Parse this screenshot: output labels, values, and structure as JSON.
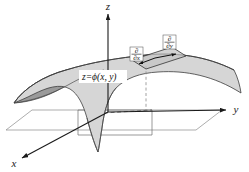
{
  "figure": {
    "caption_equation": {
      "lhs": "z",
      "equals": "=",
      "func": "ϕ",
      "args": "(x, y)",
      "full": "z=ϕ(x, y)"
    },
    "axes": [
      {
        "name": "z-axis",
        "label": "z",
        "direction": "up"
      },
      {
        "name": "y-axis",
        "label": "y",
        "direction": "right"
      },
      {
        "name": "x-axis",
        "label": "x",
        "direction": "lower-left"
      }
    ],
    "tangent_patch": {
      "name": "tangent-plane-patch",
      "vectors": [
        {
          "name": "partial-x-vector",
          "numerator": "∂",
          "denominator": "∂x",
          "direction": "lower-left"
        },
        {
          "name": "partial-y-vector",
          "numerator": "∂",
          "denominator": "∂y",
          "direction": "right"
        }
      ]
    },
    "surface": {
      "name": "saddle-surface",
      "type": "saddle",
      "top_fill": "#d6d6d6",
      "under_fill": "#9a9a9a",
      "stroke": "#3d3d3d"
    },
    "base_plane": {
      "name": "xy-base-plane",
      "stroke": "#6e6e6e"
    },
    "dashed_drop_line": {
      "name": "projection-drop-line",
      "stroke": "#7a7a7a"
    },
    "background": "#ffffff"
  }
}
